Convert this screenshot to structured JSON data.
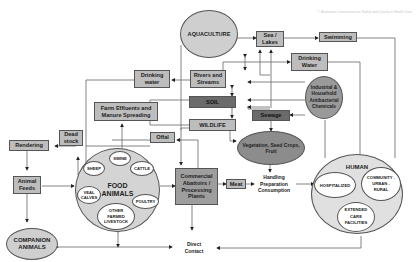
{
  "copyright": "© Australian Commission on Safety and Quality in Health Care",
  "nodes": {
    "aquaculture": "AQUACULTURE",
    "sea_lakes": "Sea / Lakes",
    "swimming": "Swimming",
    "drinking_water_left": "Drinking water",
    "drinking_water_right": "Drinking Water",
    "rivers_streams": "Rivers and Streams",
    "industrial": "Industrial & Household Antibacterial Chemicals",
    "soil": "SOIL",
    "sewage": "Sewage",
    "farm_effluents": "Farm Effluents and Manure Spreading",
    "wildlife": "WILDLIFE",
    "vegetation": "Vegetation, Seed Crops, Fruit",
    "rendering": "Rendering",
    "dead_stock": "Dead stock",
    "offal": "Offal",
    "animal_feeds": "Animal Feeds",
    "food_animals": "FOOD ANIMALS",
    "sheep": "SHEEP",
    "swine": "SWINE",
    "cattle": "CATTLE",
    "veal_calves": "VEAL CALVES",
    "poultry": "POULTRY",
    "other_livestock": "OTHER FARMED LIVESTOCK",
    "commercial": "Commercial Abattoirs / Processing Plants",
    "meat": "Meat",
    "handling": "Handling Preparation Consumption",
    "human": "HUMAN",
    "hospitalized": "HOSPITALIZED",
    "community": "COMMUNITY -URBAN -RURAL",
    "extended_care": "EXTENDED CARE FACILITIES",
    "companion_animals": "COMPANION ANIMALS",
    "direct_contact": "Direct Contact"
  }
}
